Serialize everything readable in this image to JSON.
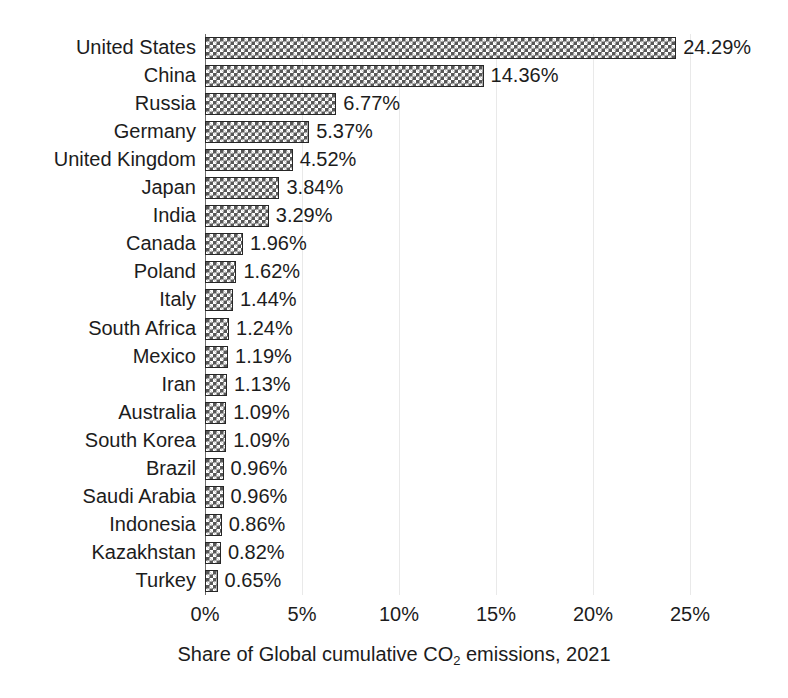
{
  "chart_data": {
    "type": "bar",
    "orientation": "horizontal",
    "title": "",
    "xlabel": "Share of Global cumulative CO2 emissions, 2021",
    "xlabel_parts": {
      "before": "Share of Global cumulative CO",
      "subscript": "2",
      "after": " emissions, 2021"
    },
    "ylabel": "",
    "xlim": [
      0,
      25
    ],
    "xticks": [
      0,
      5,
      10,
      15,
      20,
      25
    ],
    "xtick_labels": [
      "0%",
      "5%",
      "10%",
      "15%",
      "20%",
      "25%"
    ],
    "grid": "vertical-light",
    "legend": "none",
    "bar_style": {
      "fill": "#585858",
      "pattern": "checkerboard",
      "edge": "#262626"
    },
    "categories": [
      "United States",
      "China",
      "Russia",
      "Germany",
      "United Kingdom",
      "Japan",
      "India",
      "Canada",
      "Poland",
      "Italy",
      "South Africa",
      "Mexico",
      "Iran",
      "Australia",
      "South Korea",
      "Brazil",
      "Saudi Arabia",
      "Indonesia",
      "Kazakhstan",
      "Turkey"
    ],
    "values": [
      24.29,
      14.36,
      6.77,
      5.37,
      4.52,
      3.84,
      3.29,
      1.96,
      1.62,
      1.44,
      1.24,
      1.19,
      1.13,
      1.09,
      1.09,
      0.96,
      0.96,
      0.86,
      0.82,
      0.65
    ],
    "value_labels": [
      "24.29%",
      "14.36%",
      "6.77%",
      "5.37%",
      "4.52%",
      "3.84%",
      "3.29%",
      "1.96%",
      "1.62%",
      "1.44%",
      "1.24%",
      "1.19%",
      "1.13%",
      "1.09%",
      "1.09%",
      "0.96%",
      "0.96%",
      "0.86%",
      "0.82%",
      "0.65%"
    ]
  }
}
